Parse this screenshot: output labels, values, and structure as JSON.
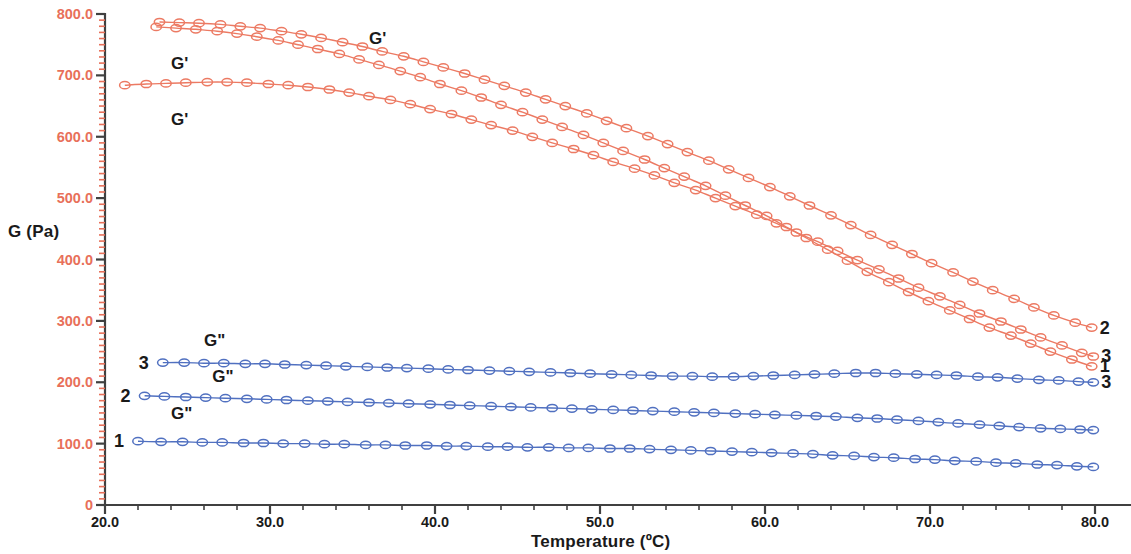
{
  "chart_data": {
    "type": "line",
    "title": "",
    "xlabel": "Temperature (ºC)",
    "ylabel": "G (Pa)",
    "xlim": [
      20.0,
      80.0
    ],
    "ylim": [
      0,
      800.0
    ],
    "grid": false,
    "legend_position": "inline-annotations",
    "x_ticks": [
      "20.0",
      "30.0",
      "40.0",
      "50.0",
      "60.0",
      "70.0",
      "80.0"
    ],
    "y_ticks": [
      "0",
      "100.0",
      "200.0",
      "300.0",
      "400.0",
      "500.0",
      "600.0",
      "700.0",
      "800.0"
    ],
    "x_minor_per_major": 5,
    "y_minor_per_major": 10,
    "axis_colors": {
      "y_tick_label": "#e8705a",
      "x_tick_label": "#1a1a1a",
      "axis_line": "#404040",
      "y_minor_tick": "#e8705a"
    },
    "series_colors": {
      "G_prime": "#ec7a63",
      "G_double_prime": "#5070c0"
    },
    "marker": "open-circle",
    "series": [
      {
        "name": "G'",
        "id": "2",
        "modulus": "G'",
        "color": "#ec7a63",
        "left_label": "",
        "right_label": "2",
        "x": [
          23.3,
          24.5,
          25.7,
          27.0,
          28.2,
          29.4,
          30.7,
          31.9,
          33.1,
          34.4,
          35.6,
          36.8,
          38.1,
          39.3,
          40.5,
          41.8,
          43.0,
          44.2,
          45.5,
          46.7,
          47.9,
          49.2,
          50.4,
          51.6,
          52.9,
          54.1,
          55.3,
          56.6,
          57.8,
          59.0,
          60.3,
          61.5,
          62.7,
          64.0,
          65.2,
          66.4,
          67.7,
          68.9,
          70.1,
          71.4,
          72.6,
          73.8,
          75.1,
          76.3,
          77.5,
          78.8,
          79.8
        ],
        "y": [
          787,
          786,
          785,
          783,
          780,
          777,
          772,
          767,
          761,
          754,
          747,
          739,
          731,
          722,
          713,
          703,
          693,
          683,
          672,
          661,
          650,
          638,
          626,
          614,
          601,
          588,
          575,
          561,
          547,
          533,
          518,
          503,
          488,
          472,
          456,
          440,
          424,
          409,
          394,
          379,
          364,
          350,
          336,
          322,
          309,
          297,
          289
        ]
      },
      {
        "name": "G'",
        "id": "1",
        "modulus": "G'",
        "color": "#ec7a63",
        "left_label": "",
        "right_label": "1",
        "x": [
          23.1,
          24.3,
          25.5,
          26.8,
          28.0,
          29.2,
          30.5,
          31.7,
          32.9,
          34.2,
          35.4,
          36.6,
          37.9,
          39.1,
          40.3,
          41.6,
          42.8,
          44.0,
          45.3,
          46.5,
          47.7,
          49.0,
          50.2,
          51.4,
          52.7,
          53.9,
          55.1,
          56.4,
          57.6,
          58.8,
          60.1,
          61.3,
          62.5,
          63.8,
          65.0,
          66.2,
          67.5,
          68.7,
          69.9,
          71.2,
          72.4,
          73.6,
          74.9,
          76.1,
          77.3,
          78.6,
          79.8
        ],
        "y": [
          779,
          777,
          775,
          772,
          768,
          763,
          757,
          750,
          743,
          735,
          726,
          717,
          707,
          697,
          686,
          675,
          664,
          652,
          640,
          628,
          616,
          603,
          590,
          577,
          563,
          549,
          535,
          520,
          504,
          488,
          471,
          453,
          435,
          416,
          398,
          380,
          363,
          347,
          332,
          317,
          303,
          289,
          276,
          263,
          250,
          237,
          226
        ]
      },
      {
        "name": "G'",
        "id": "3",
        "modulus": "G'",
        "color": "#ec7a63",
        "left_label": "",
        "right_label": "3",
        "x": [
          21.2,
          22.5,
          23.7,
          24.9,
          26.2,
          27.4,
          28.6,
          29.9,
          31.1,
          32.3,
          33.6,
          34.8,
          36.0,
          37.3,
          38.5,
          39.7,
          41.0,
          42.2,
          43.4,
          44.7,
          45.9,
          47.1,
          48.4,
          49.6,
          50.8,
          52.1,
          53.3,
          54.5,
          55.8,
          57.0,
          58.2,
          59.5,
          60.7,
          61.9,
          63.2,
          64.4,
          65.6,
          66.9,
          68.1,
          69.3,
          70.6,
          71.8,
          73.0,
          74.3,
          75.5,
          76.7,
          78.0,
          79.2,
          79.9
        ],
        "y": [
          684,
          686,
          687,
          688,
          689,
          689,
          688,
          686,
          684,
          681,
          677,
          672,
          666,
          660,
          653,
          645,
          637,
          628,
          619,
          610,
          600,
          590,
          580,
          570,
          559,
          548,
          537,
          525,
          513,
          500,
          487,
          473,
          459,
          444,
          429,
          414,
          399,
          384,
          369,
          354,
          340,
          326,
          312,
          299,
          286,
          273,
          260,
          248,
          242
        ]
      },
      {
        "name": "G\"",
        "id": "3",
        "modulus": "G\"",
        "color": "#5070c0",
        "left_label": "3",
        "right_label": "3",
        "x": [
          23.5,
          24.8,
          26.0,
          27.2,
          28.5,
          29.7,
          30.9,
          32.2,
          33.4,
          34.6,
          35.9,
          37.1,
          38.3,
          39.6,
          40.8,
          42.0,
          43.3,
          44.5,
          45.7,
          47.0,
          48.2,
          49.4,
          50.7,
          51.9,
          53.1,
          54.4,
          55.6,
          56.8,
          58.1,
          59.3,
          60.5,
          61.8,
          63.0,
          64.2,
          65.5,
          66.7,
          67.9,
          69.2,
          70.4,
          71.6,
          72.9,
          74.1,
          75.3,
          76.6,
          77.8,
          79.0,
          79.9
        ],
        "y": [
          232,
          232,
          231,
          231,
          230,
          230,
          229,
          228,
          227,
          226,
          225,
          224,
          223,
          222,
          221,
          220,
          219,
          218,
          217,
          216,
          215,
          214,
          213,
          212,
          211,
          210,
          210,
          209,
          209,
          210,
          211,
          212,
          213,
          214,
          215,
          215,
          214,
          213,
          212,
          211,
          209,
          208,
          206,
          204,
          203,
          201,
          200
        ]
      },
      {
        "name": "G\"",
        "id": "2",
        "modulus": "G\"",
        "color": "#5070c0",
        "left_label": "2",
        "right_label": "",
        "x": [
          22.4,
          23.6,
          24.9,
          26.1,
          27.3,
          28.6,
          29.8,
          31.0,
          32.3,
          33.5,
          34.7,
          36.0,
          37.2,
          38.4,
          39.7,
          40.9,
          42.1,
          43.4,
          44.6,
          45.8,
          47.1,
          48.3,
          49.5,
          50.8,
          52.0,
          53.2,
          54.5,
          55.7,
          56.9,
          58.2,
          59.4,
          60.6,
          61.9,
          63.1,
          64.3,
          65.6,
          66.8,
          68.0,
          69.3,
          70.5,
          71.7,
          73.0,
          74.2,
          75.4,
          76.7,
          77.9,
          79.1,
          79.9
        ],
        "y": [
          178,
          177,
          176,
          175,
          174,
          173,
          172,
          171,
          170,
          169,
          168,
          167,
          166,
          165,
          164,
          163,
          162,
          161,
          160,
          159,
          158,
          157,
          156,
          155,
          154,
          153,
          152,
          151,
          150,
          149,
          148,
          147,
          146,
          145,
          144,
          142,
          141,
          139,
          137,
          135,
          133,
          131,
          129,
          127,
          125,
          124,
          123,
          122
        ]
      },
      {
        "name": "G\"",
        "id": "1",
        "modulus": "G\"",
        "color": "#5070c0",
        "left_label": "1",
        "right_label": "",
        "x": [
          22.0,
          23.4,
          24.7,
          25.9,
          27.1,
          28.4,
          29.6,
          30.8,
          32.1,
          33.3,
          34.5,
          35.8,
          37.0,
          38.2,
          39.5,
          40.7,
          41.9,
          43.2,
          44.4,
          45.6,
          46.9,
          48.1,
          49.3,
          50.6,
          51.8,
          53.0,
          54.3,
          55.5,
          56.7,
          58.0,
          59.2,
          60.4,
          61.7,
          62.9,
          64.1,
          65.4,
          66.6,
          67.8,
          69.1,
          70.3,
          71.5,
          72.8,
          74.0,
          75.2,
          76.5,
          77.7,
          78.9,
          79.9
        ],
        "y": [
          104,
          103,
          103,
          102,
          102,
          101,
          101,
          100,
          100,
          99,
          99,
          98,
          98,
          97,
          97,
          96,
          96,
          95,
          95,
          94,
          94,
          93,
          93,
          92,
          92,
          91,
          90,
          89,
          88,
          87,
          86,
          85,
          84,
          83,
          81,
          80,
          78,
          77,
          75,
          74,
          72,
          71,
          69,
          68,
          66,
          65,
          63,
          62
        ]
      }
    ],
    "annotations": [
      {
        "text": "G'",
        "x": 24.0,
        "y": 718,
        "for": "G'-1"
      },
      {
        "text": "G'",
        "x": 36.0,
        "y": 760,
        "for": "G'-2"
      },
      {
        "text": "G'",
        "x": 24.0,
        "y": 628,
        "for": "G'-3"
      },
      {
        "text": "G\"",
        "x": 26.0,
        "y": 268,
        "for": "G\"-3"
      },
      {
        "text": "G\"",
        "x": 26.5,
        "y": 208,
        "for": "G\"-2"
      },
      {
        "text": "G\"",
        "x": 24.0,
        "y": 148,
        "for": "G\"-1"
      }
    ]
  }
}
